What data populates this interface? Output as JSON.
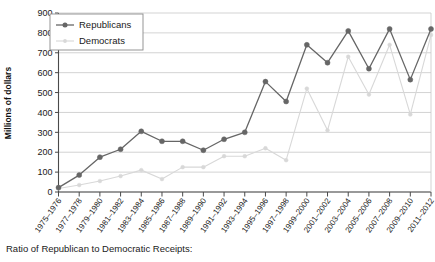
{
  "chart_data": {
    "type": "line",
    "title": "",
    "xlabel": "",
    "ylabel": "Millions of dollars",
    "ylim": [
      0,
      900
    ],
    "ytick_values": [
      0,
      100,
      200,
      300,
      400,
      500,
      600,
      700,
      800,
      900
    ],
    "grid": true,
    "legend_position": "top-left",
    "categories": [
      "1975–1976",
      "1977–1978",
      "1979–1980",
      "1981–1982",
      "1983–1984",
      "1985–1986",
      "1987–1988",
      "1989–1990",
      "1991–1992",
      "1993–1994",
      "1995–1996",
      "1997–1998",
      "1999–2000",
      "2001–2002",
      "2003–2004",
      "2005–2006",
      "2007–2008",
      "2009–2010",
      "2011–2012"
    ],
    "series": [
      {
        "name": "Republicans",
        "color": "#666666",
        "marker": "filled-circle",
        "values": [
          22,
          85,
          175,
          215,
          305,
          255,
          255,
          210,
          265,
          300,
          555,
          455,
          740,
          650,
          810,
          620,
          820,
          565,
          820
        ]
      },
      {
        "name": "Democrats",
        "color": "#d8d8d8",
        "marker": "filled-circle",
        "values": [
          18,
          35,
          55,
          80,
          110,
          65,
          125,
          125,
          180,
          180,
          220,
          160,
          520,
          310,
          680,
          490,
          740,
          390,
          790
        ]
      }
    ]
  },
  "legend": {
    "items": [
      {
        "label": "Republicans"
      },
      {
        "label": "Democrats"
      }
    ]
  },
  "caption": {
    "text": "Ratio of Republican to Democratic Receipts:"
  },
  "colors": {
    "republican": "#666666",
    "democrat": "#d8d8d8",
    "grid": "#c8c8c8",
    "axis": "#4a4a4a"
  }
}
